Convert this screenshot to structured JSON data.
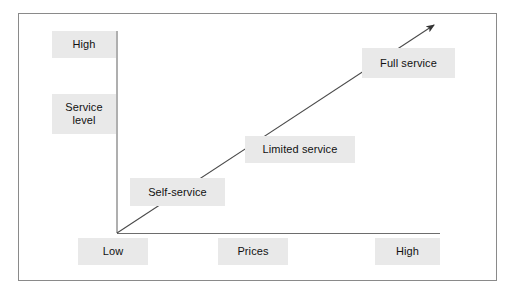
{
  "figure": {
    "type": "positioning-diagram"
  },
  "axes": {
    "y": {
      "title": "Service\nlevel",
      "high_label": "High",
      "orientation": "vertical"
    },
    "x": {
      "title": "Prices",
      "low_label": "Low",
      "high_label": "High",
      "orientation": "horizontal"
    }
  },
  "arrow": {
    "name": "trend-arrow",
    "direction": "up-right",
    "nodes": [
      {
        "id": "self",
        "label": "Self-service"
      },
      {
        "id": "limited",
        "label": "Limited service"
      },
      {
        "id": "full",
        "label": "Full service"
      }
    ]
  },
  "colors": {
    "chip_fill": "#e9e9e9",
    "line": "#6d6d6d",
    "frame": "#8a8a8a",
    "text": "#111111",
    "background": "#ffffff"
  }
}
